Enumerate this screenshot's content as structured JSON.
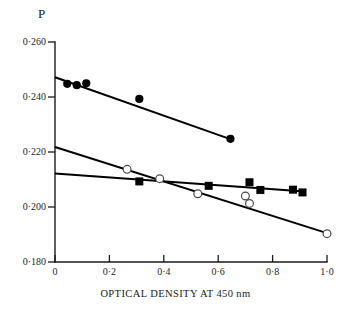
{
  "chart_data": {
    "type": "scatter",
    "title": "",
    "subtitle": "",
    "xlabel": "OPTICAL DENSITY AT 450 nm",
    "ylabel": "P",
    "xlim": [
      0,
      1.0
    ],
    "ylim": [
      0.18,
      0.26
    ],
    "grid": false,
    "legend_position": "none",
    "x_ticks": [
      {
        "value": 0,
        "label": "0"
      },
      {
        "value": 0.2,
        "label": "0·2"
      },
      {
        "value": 0.4,
        "label": "0·4"
      },
      {
        "value": 0.6,
        "label": "0·6"
      },
      {
        "value": 0.8,
        "label": "0·8"
      },
      {
        "value": 1.0,
        "label": "1·0"
      }
    ],
    "y_ticks": [
      {
        "value": 0.26,
        "label": "0·260"
      },
      {
        "value": 0.24,
        "label": "0·240"
      },
      {
        "value": 0.22,
        "label": "0·220"
      },
      {
        "value": 0.2,
        "label": "0·200"
      },
      {
        "value": 0.18,
        "label": "0·180"
      }
    ],
    "series": [
      {
        "name": "filled-circles",
        "marker": "filled-circle",
        "color": "#000000",
        "points": [
          {
            "x": 0.045,
            "y": 0.2448
          },
          {
            "x": 0.08,
            "y": 0.2443
          },
          {
            "x": 0.115,
            "y": 0.245
          },
          {
            "x": 0.31,
            "y": 0.2393
          },
          {
            "x": 0.645,
            "y": 0.2248
          }
        ],
        "fit_line": {
          "x0": 0.0,
          "y0": 0.2472,
          "x1": 0.655,
          "y1": 0.2243
        }
      },
      {
        "name": "open-circles",
        "marker": "open-circle",
        "color": "#000000",
        "points": [
          {
            "x": 0.265,
            "y": 0.2137
          },
          {
            "x": 0.385,
            "y": 0.2103
          },
          {
            "x": 0.525,
            "y": 0.2048
          },
          {
            "x": 0.7,
            "y": 0.204
          },
          {
            "x": 0.715,
            "y": 0.2013
          },
          {
            "x": 1.0,
            "y": 0.1903
          }
        ],
        "fit_line": {
          "x0": 0.0,
          "y0": 0.2218,
          "x1": 1.0,
          "y1": 0.1905
        }
      },
      {
        "name": "filled-squares",
        "marker": "filled-square",
        "color": "#000000",
        "points": [
          {
            "x": 0.31,
            "y": 0.2093
          },
          {
            "x": 0.565,
            "y": 0.2077
          },
          {
            "x": 0.715,
            "y": 0.209
          },
          {
            "x": 0.755,
            "y": 0.2062
          },
          {
            "x": 0.875,
            "y": 0.2063
          },
          {
            "x": 0.91,
            "y": 0.2053
          }
        ],
        "fit_line": {
          "x0": 0.0,
          "y0": 0.2122,
          "x1": 0.905,
          "y1": 0.2057
        }
      }
    ]
  },
  "axes": {
    "y_title": "P",
    "x_title": "OPTICAL DENSITY AT 450 nm"
  }
}
